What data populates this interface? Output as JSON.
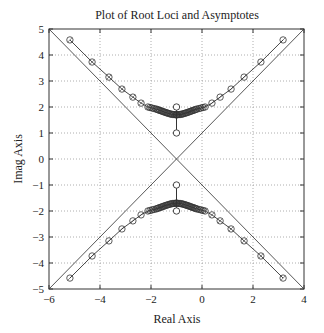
{
  "chart_data": {
    "type": "scatter",
    "title": "Plot of Root Loci and Asymptotes",
    "xlabel": "Real Axis",
    "ylabel": "Imag Axis",
    "xlim": [
      -6,
      4
    ],
    "ylim": [
      -5,
      5
    ],
    "xticks": [
      -6,
      -4,
      -2,
      0,
      2,
      4
    ],
    "yticks": [
      5,
      4,
      3,
      2,
      1,
      0,
      -1,
      -2,
      -3,
      -4,
      -5
    ],
    "grid": true,
    "legend": null,
    "asymptotes": {
      "centroid": [
        -1,
        0
      ],
      "angles_deg": [
        45,
        135,
        225,
        315
      ]
    },
    "open_loop_markers": [
      {
        "x": -1,
        "y": 1
      },
      {
        "x": -1,
        "y": 2
      },
      {
        "x": -1,
        "y": -1
      },
      {
        "x": -1,
        "y": -2
      }
    ],
    "series": [
      {
        "name": "upper-right branch",
        "points": [
          [
            -1,
            1.7
          ],
          [
            -0.8,
            1.72
          ],
          [
            -0.6,
            1.78
          ],
          [
            -0.4,
            1.85
          ],
          [
            -0.2,
            1.92
          ],
          [
            0.12,
            2.0
          ],
          [
            0.39,
            2.15
          ],
          [
            0.71,
            2.38
          ],
          [
            1.14,
            2.69
          ],
          [
            1.65,
            3.15
          ],
          [
            2.31,
            3.73
          ],
          [
            3.18,
            4.58
          ]
        ]
      },
      {
        "name": "upper-left branch",
        "points": [
          [
            -1,
            1.7
          ],
          [
            -1.2,
            1.72
          ],
          [
            -1.4,
            1.78
          ],
          [
            -1.6,
            1.85
          ],
          [
            -1.8,
            1.92
          ],
          [
            -2.12,
            2.0
          ],
          [
            -2.39,
            2.15
          ],
          [
            -2.71,
            2.38
          ],
          [
            -3.14,
            2.69
          ],
          [
            -3.65,
            3.15
          ],
          [
            -4.31,
            3.73
          ],
          [
            -5.18,
            4.58
          ]
        ]
      },
      {
        "name": "lower-right branch",
        "points": [
          [
            -1,
            -1.7
          ],
          [
            -0.8,
            -1.72
          ],
          [
            -0.6,
            -1.78
          ],
          [
            -0.4,
            -1.85
          ],
          [
            -0.2,
            -1.92
          ],
          [
            0.12,
            -2.0
          ],
          [
            0.39,
            -2.15
          ],
          [
            0.71,
            -2.38
          ],
          [
            1.14,
            -2.69
          ],
          [
            1.65,
            -3.15
          ],
          [
            2.31,
            -3.73
          ],
          [
            3.18,
            -4.58
          ]
        ]
      },
      {
        "name": "lower-left branch",
        "points": [
          [
            -1,
            -1.7
          ],
          [
            -1.2,
            -1.72
          ],
          [
            -1.4,
            -1.78
          ],
          [
            -1.6,
            -1.85
          ],
          [
            -1.8,
            -1.92
          ],
          [
            -2.12,
            -2.0
          ],
          [
            -2.39,
            -2.15
          ],
          [
            -2.71,
            -2.38
          ],
          [
            -3.14,
            -2.69
          ],
          [
            -3.65,
            -3.15
          ],
          [
            -4.31,
            -3.73
          ],
          [
            -5.18,
            -4.58
          ]
        ]
      }
    ]
  }
}
